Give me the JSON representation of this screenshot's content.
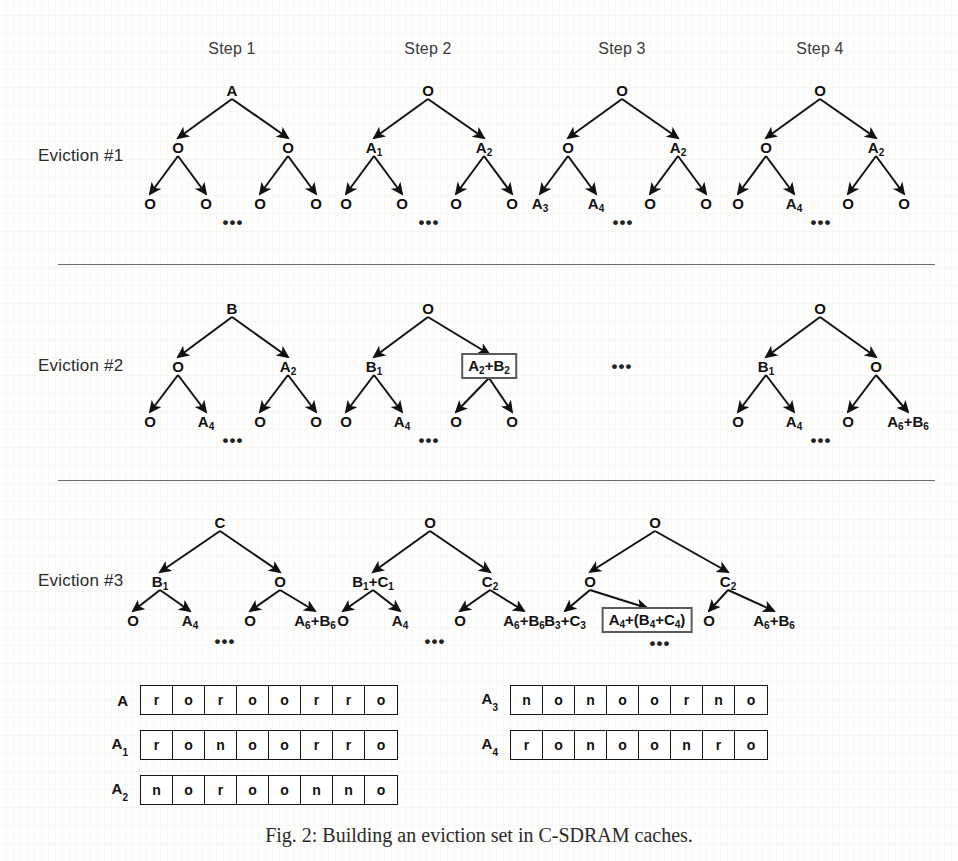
{
  "figure": {
    "caption": "Fig. 2: Building an eviction set in C-SDRAM caches.",
    "step_headers": [
      {
        "label": "Step 1",
        "x": 232,
        "y": 40
      },
      {
        "label": "Step 2",
        "x": 428,
        "y": 40
      },
      {
        "label": "Step 3",
        "x": 622,
        "y": 40
      },
      {
        "label": "Step 4",
        "x": 820,
        "y": 40
      }
    ],
    "dividers": [
      {
        "x": 58,
        "y": 264,
        "width": 877
      },
      {
        "x": 58,
        "y": 480,
        "width": 877
      }
    ],
    "rows": [
      {
        "label": "Eviction #1",
        "label_x": 38,
        "label_y": 156,
        "trees": [
          {
            "step": "Step 1",
            "root": {
              "text": "A",
              "x": 232,
              "y": 90
            },
            "level2": [
              {
                "text": "O",
                "x": 178,
                "y": 147
              },
              {
                "text": "O",
                "x": 288,
                "y": 147
              }
            ],
            "leaves": [
              {
                "text": "O",
                "x": 150,
                "y": 203
              },
              {
                "text": "O",
                "x": 206,
                "y": 203
              },
              {
                "text": "O",
                "x": 260,
                "y": 203
              },
              {
                "text": "O",
                "x": 316,
                "y": 203
              }
            ],
            "ellipsis": {
              "x": 233,
              "y": 222
            }
          },
          {
            "step": "Step 2",
            "root": {
              "text": "O",
              "x": 428,
              "y": 90
            },
            "level2": [
              {
                "text": "A",
                "sub": "1",
                "x": 374,
                "y": 147
              },
              {
                "text": "A",
                "sub": "2",
                "x": 484,
                "y": 147
              }
            ],
            "leaves": [
              {
                "text": "O",
                "x": 346,
                "y": 203
              },
              {
                "text": "O",
                "x": 402,
                "y": 203
              },
              {
                "text": "O",
                "x": 456,
                "y": 203
              },
              {
                "text": "O",
                "x": 512,
                "y": 203
              }
            ],
            "ellipsis": {
              "x": 429,
              "y": 222
            }
          },
          {
            "step": "Step 3",
            "root": {
              "text": "O",
              "x": 622,
              "y": 90
            },
            "level2": [
              {
                "text": "O",
                "x": 568,
                "y": 147
              },
              {
                "text": "A",
                "sub": "2",
                "x": 678,
                "y": 147
              }
            ],
            "leaves": [
              {
                "text": "A",
                "sub": "3",
                "x": 540,
                "y": 203
              },
              {
                "text": "A",
                "sub": "4",
                "x": 596,
                "y": 203
              },
              {
                "text": "O",
                "x": 650,
                "y": 203
              },
              {
                "text": "O",
                "x": 706,
                "y": 203
              }
            ],
            "ellipsis": {
              "x": 623,
              "y": 222
            }
          },
          {
            "step": "Step 4",
            "root": {
              "text": "O",
              "x": 820,
              "y": 90
            },
            "level2": [
              {
                "text": "O",
                "x": 766,
                "y": 147
              },
              {
                "text": "A",
                "sub": "2",
                "x": 876,
                "y": 147
              }
            ],
            "leaves": [
              {
                "text": "O",
                "x": 738,
                "y": 203
              },
              {
                "text": "A",
                "sub": "4",
                "x": 794,
                "y": 203
              },
              {
                "text": "O",
                "x": 848,
                "y": 203
              },
              {
                "text": "O",
                "x": 904,
                "y": 203
              }
            ],
            "ellipsis": {
              "x": 821,
              "y": 222
            }
          }
        ]
      },
      {
        "label": "Eviction #2",
        "label_x": 38,
        "label_y": 366,
        "trees": [
          {
            "step": "Step 1",
            "root": {
              "text": "B",
              "x": 232,
              "y": 308
            },
            "level2": [
              {
                "text": "O",
                "x": 178,
                "y": 366
              },
              {
                "text": "A",
                "sub": "2",
                "x": 288,
                "y": 366
              }
            ],
            "leaves": [
              {
                "text": "O",
                "x": 150,
                "y": 421
              },
              {
                "text": "A",
                "sub": "4",
                "x": 206,
                "y": 421
              },
              {
                "text": "O",
                "x": 260,
                "y": 421
              },
              {
                "text": "O",
                "x": 316,
                "y": 421
              }
            ],
            "ellipsis": {
              "x": 233,
              "y": 440
            }
          },
          {
            "step": "Step 2",
            "root": {
              "text": "O",
              "x": 428,
              "y": 308
            },
            "level2": [
              {
                "text": "B",
                "sub": "1",
                "x": 374,
                "y": 366
              },
              {
                "text": "A",
                "sub": "2",
                "text2": "+B",
                "sub2": "2",
                "boxed": true,
                "x": 489,
                "y": 366
              }
            ],
            "leaves": [
              {
                "text": "O",
                "x": 346,
                "y": 421
              },
              {
                "text": "A",
                "sub": "4",
                "x": 402,
                "y": 421
              },
              {
                "text": "O",
                "x": 456,
                "y": 421
              },
              {
                "text": "O",
                "x": 512,
                "y": 421
              }
            ],
            "ellipsis": {
              "x": 429,
              "y": 440
            }
          },
          {
            "step": "Step 3",
            "placeholder_ellipsis": {
              "x": 622,
              "y": 366
            }
          },
          {
            "step": "Step 4",
            "root": {
              "text": "O",
              "x": 820,
              "y": 308
            },
            "level2": [
              {
                "text": "B",
                "sub": "1",
                "x": 766,
                "y": 366
              },
              {
                "text": "O",
                "x": 876,
                "y": 366
              }
            ],
            "leaves": [
              {
                "text": "O",
                "x": 738,
                "y": 421
              },
              {
                "text": "A",
                "sub": "4",
                "x": 794,
                "y": 421
              },
              {
                "text": "O",
                "x": 848,
                "y": 421
              },
              {
                "text": "A",
                "sub": "6",
                "text2": "+B",
                "sub2": "6",
                "x": 908,
                "y": 421
              }
            ],
            "ellipsis": {
              "x": 821,
              "y": 440
            }
          }
        ]
      },
      {
        "label": "Eviction #3",
        "label_x": 38,
        "label_y": 581,
        "trees": [
          {
            "step": "Step 1",
            "root": {
              "text": "C",
              "x": 220,
              "y": 522
            },
            "level2": [
              {
                "text": "B",
                "sub": "1",
                "x": 160,
                "y": 581
              },
              {
                "text": "O",
                "x": 280,
                "y": 581
              }
            ],
            "leaves": [
              {
                "text": "O",
                "x": 133,
                "y": 620
              },
              {
                "text": "A",
                "sub": "4",
                "x": 190,
                "y": 620
              },
              {
                "text": "O",
                "x": 250,
                "y": 620
              },
              {
                "text": "A",
                "sub": "6",
                "text2": "+B",
                "sub2": "6",
                "x": 315,
                "y": 620
              }
            ],
            "ellipsis": {
              "x": 225,
              "y": 641
            }
          },
          {
            "step": "Step 2",
            "root": {
              "text": "O",
              "x": 430,
              "y": 522
            },
            "level2": [
              {
                "text": "B",
                "sub": "1",
                "text2": "+C",
                "sub2": "1",
                "x": 373,
                "y": 581
              },
              {
                "text": "C",
                "sub": "2",
                "x": 490,
                "y": 581
              }
            ],
            "leaves": [
              {
                "text": "O",
                "x": 343,
                "y": 620
              },
              {
                "text": "A",
                "sub": "4",
                "x": 400,
                "y": 620
              },
              {
                "text": "O",
                "x": 460,
                "y": 620
              },
              {
                "text": "A",
                "sub": "6",
                "text2": "+B",
                "sub2": "6",
                "x": 524,
                "y": 620
              }
            ],
            "ellipsis": {
              "x": 435,
              "y": 641
            }
          },
          {
            "step": "Step 3",
            "root": {
              "text": "O",
              "x": 655,
              "y": 522
            },
            "level2": [
              {
                "text": "O",
                "x": 590,
                "y": 581
              },
              {
                "text": "C",
                "sub": "2",
                "x": 728,
                "y": 581
              }
            ],
            "leaves": [
              {
                "text": "B",
                "sub": "3",
                "text2": "+C",
                "sub2": "3",
                "x": 565,
                "y": 620
              },
              {
                "text": "A",
                "sub": "4",
                "text2": "+(B",
                "sub2": "4",
                "text3": "+C",
                "sub3": "4",
                "text4": ")",
                "boxed": true,
                "x": 647,
                "y": 620
              },
              {
                "text": "O",
                "x": 709,
                "y": 620
              },
              {
                "text": "A",
                "sub": "6",
                "text2": "+B",
                "sub2": "6",
                "x": 774,
                "y": 620
              }
            ],
            "ellipsis": {
              "x": 660,
              "y": 643
            }
          }
        ]
      }
    ],
    "bit_arrays": [
      {
        "label": "A",
        "sub": "",
        "x": 140,
        "y": 700,
        "cells": [
          "r",
          "o",
          "r",
          "o",
          "o",
          "r",
          "r",
          "o"
        ]
      },
      {
        "label": "A",
        "sub": "1",
        "x": 140,
        "y": 745,
        "cells": [
          "r",
          "o",
          "n",
          "o",
          "o",
          "r",
          "r",
          "o"
        ]
      },
      {
        "label": "A",
        "sub": "2",
        "x": 140,
        "y": 790,
        "cells": [
          "n",
          "o",
          "r",
          "o",
          "o",
          "n",
          "n",
          "o"
        ]
      },
      {
        "label": "A",
        "sub": "3",
        "x": 510,
        "y": 700,
        "cells": [
          "n",
          "o",
          "n",
          "o",
          "o",
          "r",
          "n",
          "o"
        ]
      },
      {
        "label": "A",
        "sub": "4",
        "x": 510,
        "y": 745,
        "cells": [
          "r",
          "o",
          "n",
          "o",
          "o",
          "n",
          "r",
          "o"
        ]
      }
    ],
    "colors": {
      "ink": "#111111",
      "divider": "#6d6d6d",
      "box_border": "#5a5a5a",
      "page": "#fdfdfc"
    }
  }
}
